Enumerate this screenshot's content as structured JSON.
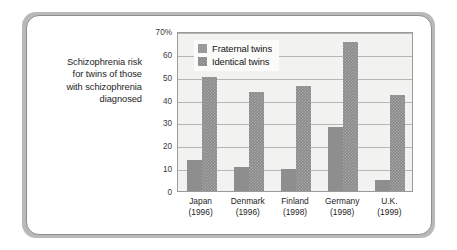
{
  "caption": {
    "lines": [
      "Schizophrenia risk",
      "for twins of those",
      "with schizophrenia",
      "diagnosed"
    ]
  },
  "colors": {
    "card_background": "#ffffff",
    "mat_background": "#b9b9b9",
    "plot_background": "#f2f2f0",
    "gridline": "#b6b6b4",
    "axis_border": "#9a9a9a",
    "fraternal_bar": "#8e8e8e",
    "identical_bar": "#8a8a8a",
    "text": "#1d1d1d"
  },
  "chart_data": {
    "type": "bar",
    "title": "",
    "subtitle": "",
    "xlabel": "",
    "ylabel": "",
    "ylim": [
      0,
      70
    ],
    "yticks": [
      0,
      10,
      20,
      30,
      40,
      50,
      60,
      70
    ],
    "ytick_labels": [
      "0",
      "10",
      "20",
      "30",
      "40",
      "50",
      "60",
      "70%"
    ],
    "grid": true,
    "legend_position": "top-left inside plot",
    "categories": [
      "Japan",
      "Denmark",
      "Finland",
      "Germany",
      "U.K."
    ],
    "category_years": [
      "(1996)",
      "(1996)",
      "(1998)",
      "(1998)",
      "(1999)"
    ],
    "series": [
      {
        "name": "Fraternal twins",
        "values": [
          13.5,
          10.5,
          9.5,
          28,
          5
        ]
      },
      {
        "name": "Identical twins",
        "values": [
          50,
          43.5,
          46,
          65,
          42
        ]
      }
    ]
  }
}
